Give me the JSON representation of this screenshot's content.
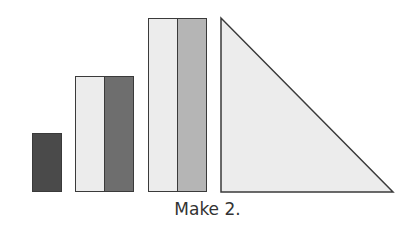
{
  "caption": "Make 2.",
  "colors": {
    "dark": "#4a4a4a",
    "medium": "#6e6e6e",
    "light_gray": "#b5b5b5",
    "pale": "#ececec",
    "outline": "#3a3a3a"
  },
  "shapes": [
    {
      "type": "rect",
      "name": "small-dark-block",
      "x": 32,
      "y": 133,
      "w": 30,
      "h": 59,
      "fill": "dark"
    },
    {
      "type": "rect",
      "name": "medium-left-pale",
      "x": 75,
      "y": 76,
      "w": 30,
      "h": 116,
      "fill": "pale"
    },
    {
      "type": "rect",
      "name": "medium-right-gray",
      "x": 104,
      "y": 76,
      "w": 30,
      "h": 116,
      "fill": "medium"
    },
    {
      "type": "rect",
      "name": "tall-left-pale",
      "x": 148,
      "y": 18,
      "w": 30,
      "h": 174,
      "fill": "pale"
    },
    {
      "type": "rect",
      "name": "tall-right-lightgray",
      "x": 177,
      "y": 18,
      "w": 30,
      "h": 174,
      "fill": "light_gray"
    },
    {
      "type": "triangle",
      "name": "right-triangle",
      "points": "221,18 221,192 393,192",
      "fill": "pale"
    }
  ]
}
